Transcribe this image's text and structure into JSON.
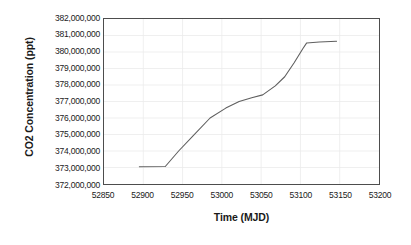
{
  "chart_data": {
    "type": "line",
    "title": "",
    "xlabel": "Time (MJD)",
    "ylabel": "CO2 Concentration (ppt)",
    "xlim": [
      52850,
      53200
    ],
    "ylim": [
      372000000,
      382000000
    ],
    "xticks": [
      52850,
      52900,
      52950,
      53000,
      53050,
      53100,
      53150,
      53200
    ],
    "xtick_labels": [
      "52850",
      "52900",
      "52950",
      "53000",
      "53050",
      "53100",
      "53150",
      "53200"
    ],
    "yticks": [
      372000000,
      373000000,
      374000000,
      375000000,
      376000000,
      377000000,
      378000000,
      379000000,
      380000000,
      381000000,
      382000000
    ],
    "ytick_labels": [
      "382,000,000",
      "381,000,000",
      "380,000,000",
      "379,000,000",
      "378,000,000",
      "377,000,000",
      "376,000,000",
      "375,000,000",
      "374,000,000",
      "373,000,000",
      "372,000,000"
    ],
    "grid": true,
    "legend": false,
    "line_color": "#5f5f5f",
    "frame_color": "#4d4d4d",
    "grid_color": "#ebebeb",
    "series": [
      {
        "name": "CO2 Concentration",
        "x": [
          52895,
          52928,
          52945,
          52963,
          52985,
          53005,
          53022,
          53038,
          53052,
          53068,
          53080,
          53092,
          53103,
          53108,
          53124,
          53146
        ],
        "y": [
          373050000,
          373060000,
          374000000,
          374900000,
          376000000,
          376600000,
          377000000,
          377230000,
          377400000,
          377950000,
          378500000,
          379350000,
          380200000,
          380550000,
          380610000,
          380650000
        ]
      }
    ]
  }
}
